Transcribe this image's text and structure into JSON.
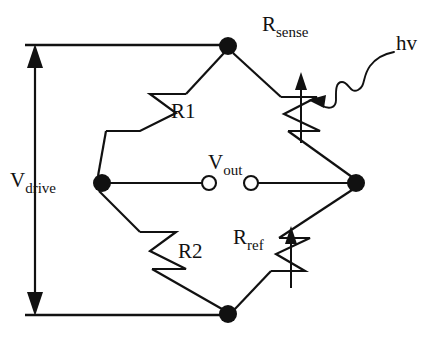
{
  "figure": {
    "name": "wheatstone-bridge-photodetector-circuit",
    "background_color": "#ffffff",
    "line_color": "#111111",
    "width": 443,
    "height": 338
  },
  "labels": {
    "r_sense": {
      "base": "R",
      "sub": "sense"
    },
    "hv": {
      "base": "hv",
      "sub": ""
    },
    "r1": {
      "base": "R1",
      "sub": ""
    },
    "r2": {
      "base": "R2",
      "sub": ""
    },
    "r_ref": {
      "base": "R",
      "sub": "ref"
    },
    "v_out": {
      "base": "V",
      "sub": "out"
    },
    "v_drive": {
      "base": "V",
      "sub": "drive"
    }
  },
  "nodes": {
    "top": {
      "x": 228,
      "y": 46,
      "r": 9
    },
    "left": {
      "x": 102,
      "y": 183,
      "r": 9
    },
    "right": {
      "x": 356,
      "y": 183,
      "r": 9
    },
    "bottom": {
      "x": 228,
      "y": 314,
      "r": 9
    }
  },
  "terminals": {
    "v_out_left": {
      "x": 209,
      "y": 183,
      "r": 7
    },
    "v_out_right": {
      "x": 251,
      "y": 183,
      "r": 7
    }
  },
  "components": [
    {
      "name": "R1",
      "type": "resistor",
      "variable": false,
      "branch": "top-left"
    },
    {
      "name": "R_sense",
      "type": "resistor",
      "variable": true,
      "branch": "top-right",
      "illuminated": true
    },
    {
      "name": "R2",
      "type": "resistor",
      "variable": false,
      "branch": "bottom-left"
    },
    {
      "name": "R_ref",
      "type": "resistor",
      "variable": true,
      "branch": "bottom-right"
    }
  ],
  "annotations": {
    "photon_arrow": {
      "from": "hv",
      "to": "R_sense",
      "style": "wavy-arrow"
    },
    "drive_arrow": {
      "style": "double-headed-vertical",
      "label": "V_drive"
    }
  }
}
